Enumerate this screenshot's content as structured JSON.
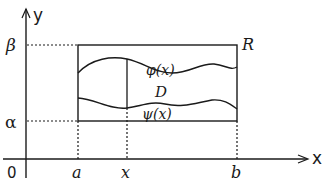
{
  "diagram": {
    "type": "region-of-integration",
    "axes": {
      "x_label": "x",
      "y_label": "y",
      "origin_label": "0"
    },
    "x_ticks": [
      {
        "label": "a",
        "pos": 78
      },
      {
        "label": "x",
        "pos": 127
      },
      {
        "label": "b",
        "pos": 237
      }
    ],
    "y_ticks": [
      {
        "label": "β",
        "pos": 45
      },
      {
        "label": "α",
        "pos": 121
      }
    ],
    "rectangle_label": "R",
    "region_label": "D",
    "upper_curve_label": "φ(x)",
    "lower_curve_label": "ψ(x)",
    "colors": {
      "ink": "#1a1a1a",
      "background": "#ffffff"
    }
  }
}
